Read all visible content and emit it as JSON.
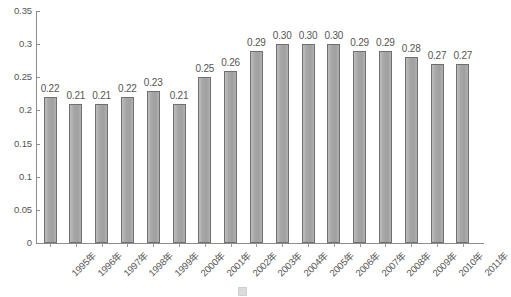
{
  "chart_data": {
    "type": "bar",
    "title": "",
    "xlabel": "",
    "ylabel": "",
    "ylim": [
      0,
      0.35
    ],
    "ytick_labels": [
      "0",
      "0.05",
      "0.1",
      "0.15",
      "0.2",
      "0.25",
      "0.3",
      "0.35"
    ],
    "ytick_values": [
      0,
      0.05,
      0.1,
      0.15,
      0.2,
      0.25,
      0.3,
      0.35
    ],
    "grid": false,
    "legend": "none",
    "bar_color": "#a9a9a9",
    "bar_edge_color": "#6f6f6f",
    "axis_color": "#8c8c8c",
    "categories": [
      "1995年",
      "1996年",
      "1997年",
      "1998年",
      "1999年",
      "2000年",
      "2001年",
      "2002年",
      "2003年",
      "2004年",
      "2005年",
      "2006年",
      "2007年",
      "2008年",
      "2009年",
      "2010年",
      "2011年"
    ],
    "values": [
      0.22,
      0.21,
      0.21,
      0.22,
      0.23,
      0.21,
      0.25,
      0.26,
      0.29,
      0.3,
      0.3,
      0.3,
      0.29,
      0.29,
      0.28,
      0.27,
      0.27
    ],
    "data_labels": [
      "0.22",
      "0.21",
      "0.21",
      "0.22",
      "0.23",
      "0.21",
      "0.25",
      "0.26",
      "0.29",
      "0.30",
      "0.30",
      "0.30",
      "0.29",
      "0.29",
      "0.28",
      "0.27",
      "0.27"
    ]
  },
  "caption": {
    "text": ""
  }
}
